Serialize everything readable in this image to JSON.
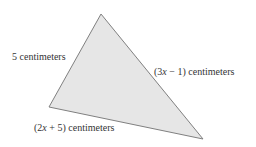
{
  "diagram": {
    "shape": "triangle",
    "fill_color": "#e6e6e6",
    "stroke_color": "#808080",
    "vertices": {
      "top": [
        101,
        14
      ],
      "left": [
        49,
        107
      ],
      "right": [
        203,
        139
      ]
    },
    "sides": [
      {
        "id": "left-side",
        "label": "5 centimeters"
      },
      {
        "id": "right-side",
        "label_prefix": "(3",
        "label_var": "x",
        "label_suffix": " − 1) centimeters"
      },
      {
        "id": "bottom-side",
        "label_prefix": "(2",
        "label_var": "x",
        "label_suffix": " + 5) centimeters"
      }
    ]
  }
}
